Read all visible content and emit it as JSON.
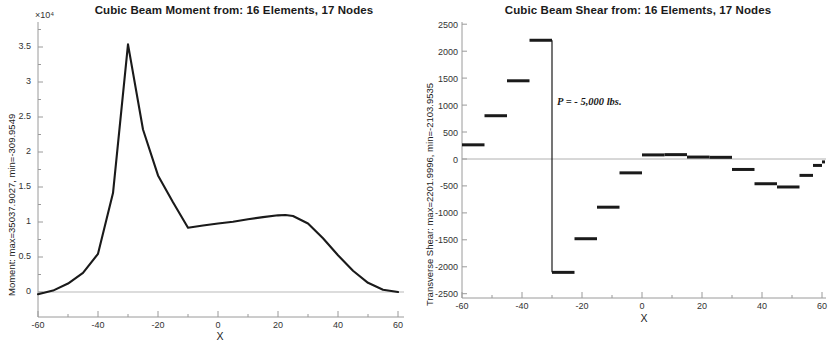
{
  "figures": [
    {
      "id": "moment",
      "title": "Cubic Beam Moment from:  16 Elements, 17 Nodes",
      "exponent_label": "×10⁴",
      "ylabel": "Moment: max=35037.9027, min=-309.9549",
      "xlabel": "X",
      "xticks": [
        "-60",
        "-40",
        "-20",
        "0",
        "20",
        "40",
        "60"
      ],
      "yticks": [
        "0",
        "0.5",
        "1",
        "1.5",
        "2",
        "2.5",
        "3",
        "3.5"
      ]
    },
    {
      "id": "shear",
      "title": "Cubic Beam Shear from:  16 Elements, 17 Nodes",
      "exponent_label": "",
      "ylabel": "Transverse Shear: max=2201.9996, min=-2103.9535",
      "xlabel": "X",
      "annotation": "P = - 5,000 lbs.",
      "xticks": [
        "-60",
        "-40",
        "-20",
        "0",
        "20",
        "40",
        "60"
      ],
      "yticks": [
        "-2500",
        "-2000",
        "-1500",
        "-1000",
        "-500",
        "0",
        "500",
        "1000",
        "1500",
        "2000",
        "2500"
      ]
    }
  ],
  "chart_data": [
    {
      "type": "line",
      "title": "Cubic Beam Moment from:  16 Elements, 17 Nodes",
      "xlabel": "X",
      "ylabel": "Moment: max=35037.9027, min=-309.9549",
      "xlim": [
        -60,
        60
      ],
      "ylim": [
        0,
        37500
      ],
      "yscale_exponent": 10000,
      "grid": false,
      "legend": "none",
      "series": [
        {
          "name": "Moment",
          "x": [
            -60,
            -55,
            -50,
            -45,
            -40,
            -35,
            -30,
            -25,
            -20,
            -15,
            -10,
            -5,
            0,
            5,
            10,
            15,
            20,
            22.5,
            25,
            30,
            35,
            40,
            45,
            50,
            55,
            60
          ],
          "values": [
            -310,
            200,
            1200,
            2700,
            5400,
            14000,
            35038,
            23000,
            16500,
            12700,
            9100,
            9400,
            9700,
            9950,
            10300,
            10600,
            10850,
            10900,
            10750,
            9700,
            7600,
            5200,
            3000,
            1300,
            320,
            0
          ]
        }
      ],
      "annotations": [
        {
          "text": "×10⁴",
          "role": "y-axis-exponent"
        }
      ]
    },
    {
      "type": "bar",
      "bar_style": "piecewise-constant-steps",
      "title": "Cubic Beam Shear from:  16 Elements, 17 Nodes",
      "xlabel": "X",
      "ylabel": "Transverse Shear: max=2201.9996, min=-2103.9535",
      "xlim": [
        -60,
        60
      ],
      "ylim": [
        -2500,
        2500
      ],
      "grid": false,
      "legend": "none",
      "note": "16 element-wise constant shear segments spanning x from -60 to 60 in 7.5-unit steps",
      "segments": [
        {
          "x_start": -60,
          "x_end": -52.5,
          "value": 262
        },
        {
          "x_start": -52.5,
          "x_end": -45,
          "value": 802
        },
        {
          "x_start": -45,
          "x_end": -37.5,
          "value": 1450
        },
        {
          "x_start": -37.5,
          "x_end": -30,
          "value": 2202
        },
        {
          "x_start": -30,
          "x_end": -22.5,
          "value": -2104
        },
        {
          "x_start": -22.5,
          "x_end": -15,
          "value": -1480
        },
        {
          "x_start": -15,
          "x_end": -7.5,
          "value": -895
        },
        {
          "x_start": -7.5,
          "x_end": 0,
          "value": -258
        },
        {
          "x_start": 0,
          "x_end": 7.5,
          "value": 75
        },
        {
          "x_start": 7.5,
          "x_end": 15,
          "value": 80
        },
        {
          "x_start": 15,
          "x_end": 22.5,
          "value": 35
        },
        {
          "x_start": 22.5,
          "x_end": 30,
          "value": 30
        },
        {
          "x_start": 30,
          "x_end": 37.5,
          "value": -195
        },
        {
          "x_start": 37.5,
          "x_end": 45,
          "value": -460
        },
        {
          "x_start": 45,
          "x_end": 52.5,
          "value": -520
        },
        {
          "x_start": 52.5,
          "x_end": 57,
          "value": -305
        },
        {
          "x_start": 57,
          "x_end": 60,
          "value": -120
        },
        {
          "x_start": 60,
          "x_end": 61,
          "value": -55
        }
      ],
      "annotations": [
        {
          "text": "P = - 5,000 lbs.",
          "x": -27,
          "y": 1000,
          "role": "load-label"
        }
      ]
    }
  ],
  "colors": {
    "line": "#1a1a1a",
    "axis": "#9a9a9a",
    "text": "#222222",
    "background": "#ffffff"
  }
}
